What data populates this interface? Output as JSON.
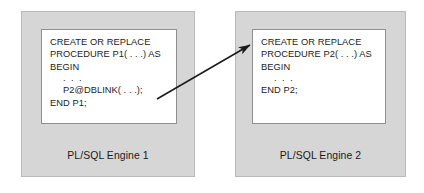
{
  "diagram": {
    "background_color": "#ffffff",
    "box_fill_color": "#d6d6d6",
    "code_fill_color": "#ffffff",
    "text_color": "#1b1b1b",
    "arrow_color": "#1a1a1a"
  },
  "left_engine": {
    "label": "PL/SQL Engine 1",
    "code_lines": [
      {
        "text": "CREATE OR REPLACE",
        "indent": false,
        "dots": false
      },
      {
        "text": "PROCEDURE P1( . . .) AS",
        "indent": false,
        "dots": false
      },
      {
        "text": "BEGIN",
        "indent": false,
        "dots": false
      },
      {
        "text": ". . .",
        "indent": true,
        "dots": true
      },
      {
        "text": "P2@DBLINK( . . .);",
        "indent": true,
        "dots": false
      },
      {
        "text": "END P1;",
        "indent": false,
        "dots": false
      }
    ]
  },
  "right_engine": {
    "label": "PL/SQL Engine 2",
    "code_lines": [
      {
        "text": "CREATE OR REPLACE",
        "indent": false,
        "dots": false
      },
      {
        "text": "PROCEDURE P2( . . .) AS",
        "indent": false,
        "dots": false
      },
      {
        "text": "BEGIN",
        "indent": false,
        "dots": false
      },
      {
        "text": ". . .",
        "indent": true,
        "dots": true
      },
      {
        "text": "END P2;",
        "indent": false,
        "dots": false
      }
    ]
  },
  "arrow": {
    "name": "remote-call-arrow",
    "from_x": 157,
    "from_y": 99,
    "to_x": 250,
    "to_y": 45
  }
}
